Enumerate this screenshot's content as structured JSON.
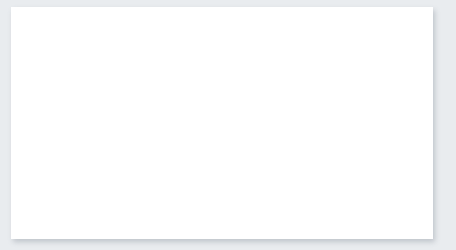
{
  "chart_data": {
    "type": "line",
    "title": "",
    "xlabel": "",
    "ylabel": "Earnings per Share (1996 = 1.0)",
    "xlim": [
      1996,
      2016
    ],
    "ylim": [
      0.0,
      9.0
    ],
    "grid": false,
    "legend_position": "inline-annotation",
    "x": [
      1996,
      1997,
      1998,
      1999,
      2000,
      2001,
      2002,
      2003,
      2004,
      2005,
      2006,
      2007,
      2008,
      2009,
      2010,
      2011,
      2012,
      2013,
      2014,
      2015,
      2016
    ],
    "x_tick_labels": [
      "1996",
      "1998",
      "2000",
      "2002",
      "2004",
      "2006",
      "2008",
      "2010",
      "2012",
      "2014",
      "2016"
    ],
    "x_tick_values": [
      1996,
      1998,
      2000,
      2002,
      2004,
      2006,
      2008,
      2010,
      2012,
      2014,
      2016
    ],
    "y_tick_labels": [
      "0.0",
      "1.0",
      "2.0",
      "3.0",
      "4.0",
      "5.0",
      "6.0",
      "7.0",
      "8.0",
      "9.0"
    ],
    "y_tick_values": [
      0.0,
      1.0,
      2.0,
      3.0,
      4.0,
      5.0,
      6.0,
      7.0,
      8.0,
      9.0
    ],
    "series": [
      {
        "name": "FedEx",
        "color": "#5b2b2b",
        "label_x": 2007,
        "label_y": 5.75,
        "values": [
          1.02,
          1.15,
          1.5,
          1.6,
          1.78,
          1.75,
          1.82,
          2.05,
          2.6,
          3.35,
          4.35,
          5.02,
          4.55,
          2.9,
          2.9,
          3.7,
          4.98,
          4.72,
          5.1,
          6.5,
          8.2
        ]
      },
      {
        "name": "Con Ed",
        "color": "#1b1f2a",
        "label_x": 2012.6,
        "label_y": 1.95,
        "values": [
          1.02,
          0.98,
          1.0,
          1.08,
          0.93,
          1.1,
          1.1,
          1.0,
          0.85,
          1.02,
          1.08,
          1.25,
          1.2,
          1.15,
          1.25,
          1.28,
          1.4,
          1.32,
          1.38,
          1.45,
          1.4
        ]
      }
    ]
  }
}
